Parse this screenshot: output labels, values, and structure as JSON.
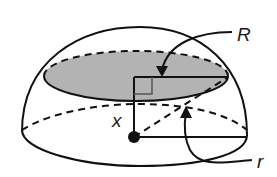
{
  "diagram": {
    "labels": {
      "section_radius": "R",
      "height": "x",
      "sphere_radius": "r"
    },
    "colors": {
      "stroke": "#111111",
      "section_fill": "#b3b3b3",
      "background": "#ffffff"
    }
  }
}
